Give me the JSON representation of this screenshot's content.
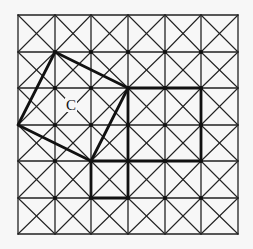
{
  "grid": {
    "cols": 6,
    "rows": 6,
    "x_lines": [
      18,
      55,
      91,
      128,
      165,
      201,
      238
    ],
    "y_lines": [
      15,
      52,
      88,
      125,
      161,
      198,
      234
    ],
    "cell_diagonals": true,
    "line_color": "#222222",
    "thick_color": "#111111"
  },
  "shapes": [
    {
      "name": "tilted-square",
      "points": [
        [
          1,
          1
        ],
        [
          3,
          2
        ],
        [
          2,
          4
        ],
        [
          0,
          3
        ]
      ]
    },
    {
      "name": "rectangle",
      "points": [
        [
          3,
          2
        ],
        [
          5,
          2
        ],
        [
          5,
          4
        ],
        [
          3,
          4
        ]
      ]
    },
    {
      "name": "small-square",
      "points": [
        [
          2,
          4
        ],
        [
          3,
          4
        ],
        [
          3,
          5
        ],
        [
          2,
          5
        ]
      ]
    }
  ],
  "labels": [
    {
      "text": "C",
      "x": 71,
      "y": 110
    }
  ]
}
